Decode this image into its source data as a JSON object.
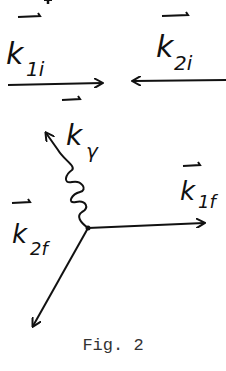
{
  "figure": {
    "caption": "Fig. 2",
    "vertex": {
      "x": 88,
      "y": 228
    },
    "vectors": [
      {
        "id": "k1i",
        "label": "k",
        "subscript": "1i",
        "kind": "incoming",
        "line": "solid"
      },
      {
        "id": "k2i",
        "label": "k",
        "subscript": "2i",
        "kind": "incoming",
        "line": "solid"
      },
      {
        "id": "kgamma",
        "label": "k",
        "subscript": "γ",
        "kind": "outgoing-photon",
        "line": "wavy"
      },
      {
        "id": "k1f",
        "label": "k",
        "subscript": "1f",
        "kind": "outgoing",
        "line": "solid"
      },
      {
        "id": "k2f",
        "label": "k",
        "subscript": "2f",
        "kind": "outgoing",
        "line": "solid"
      }
    ],
    "stroke_color": "#111111",
    "background": "#ffffff"
  }
}
